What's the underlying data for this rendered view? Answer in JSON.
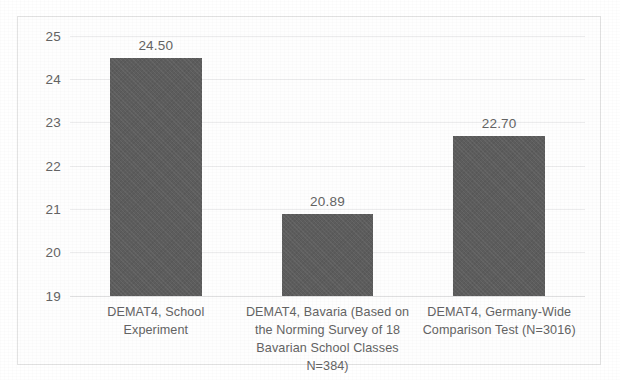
{
  "chart_data": {
    "type": "bar",
    "title": "",
    "subtitle": "",
    "xlabel": "",
    "ylabel": "",
    "ylim": [
      19,
      25
    ],
    "ytick_step": 1,
    "yticks": [
      "25",
      "24",
      "23",
      "22",
      "21",
      "20",
      "19"
    ],
    "grid": true,
    "legend": false,
    "legend_position": "none",
    "categories": [
      "DEMAT4, School Experiment",
      "DEMAT4, Bavaria (Based on the Norming Survey of 18 Bavarian School Classes N=384)",
      "DEMAT4, Germany-Wide Comparison Test (N=3016)"
    ],
    "category_lines": [
      [
        "DEMAT4, School Experiment"
      ],
      [
        "DEMAT4, Bavaria (Based on",
        "the Norming Survey of 18",
        "Bavarian School Classes",
        "N=384)"
      ],
      [
        "DEMAT4, Germany-Wide",
        "Comparison Test (N=3016)"
      ]
    ],
    "values": [
      24.5,
      20.89,
      22.7
    ],
    "value_labels": [
      "24.50",
      "20.89",
      "22.70"
    ],
    "bar_color": "#5d5d5d",
    "gridline_color": "#ececed",
    "text_color": "#636363",
    "frame_color": "#e3e3e3",
    "plot_background": "#fefefe"
  }
}
